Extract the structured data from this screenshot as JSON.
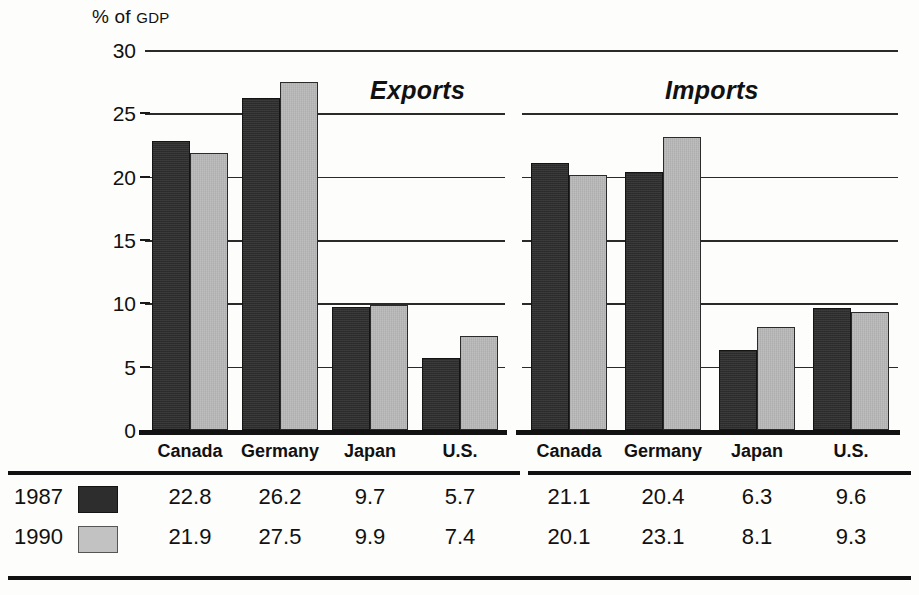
{
  "axis_title": {
    "main": "% of ",
    "small": "GDP"
  },
  "panels": [
    {
      "key": "exports",
      "label": "Exports"
    },
    {
      "key": "imports",
      "label": "Imports"
    }
  ],
  "legend": [
    {
      "year": "1987",
      "color": "#2d2d2d"
    },
    {
      "year": "1990",
      "color": "#c2c2c2"
    }
  ],
  "yticks": [
    "0",
    "5",
    "10",
    "15",
    "20",
    "25",
    "30"
  ],
  "categories": [
    "Canada",
    "Germany",
    "Japan",
    "U.S."
  ],
  "chart_data": {
    "type": "bar",
    "title": "",
    "xlabel": "",
    "ylabel": "% of GDP",
    "ylim": [
      0,
      30
    ],
    "ytick_step": 5,
    "grid": true,
    "legend_position": "bottom-table",
    "categories": [
      "Canada",
      "Germany",
      "Japan",
      "U.S."
    ],
    "panels": [
      {
        "name": "Exports",
        "series": [
          {
            "name": "1987",
            "color": "#2d2d2d",
            "values": [
              22.8,
              26.2,
              9.7,
              5.7
            ]
          },
          {
            "name": "1990",
            "color": "#b9b9b9",
            "values": [
              21.9,
              27.5,
              9.9,
              7.4
            ]
          }
        ]
      },
      {
        "name": "Imports",
        "series": [
          {
            "name": "1987",
            "color": "#2d2d2d",
            "values": [
              21.1,
              20.4,
              6.3,
              9.6
            ]
          },
          {
            "name": "1990",
            "color": "#b9b9b9",
            "values": [
              20.1,
              23.1,
              8.1,
              9.3
            ]
          }
        ]
      }
    ]
  },
  "table": {
    "rows": [
      {
        "year": "1987",
        "values": [
          "22.8",
          "26.2",
          "9.7",
          "5.7",
          "21.1",
          "20.4",
          "6.3",
          "9.6"
        ]
      },
      {
        "year": "1990",
        "values": [
          "21.9",
          "27.5",
          "9.9",
          "7.4",
          "20.1",
          "23.1",
          "8.1",
          "9.3"
        ]
      }
    ]
  }
}
